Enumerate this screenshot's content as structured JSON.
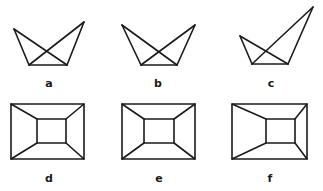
{
  "figure": {
    "colors": {
      "stroke": "#1a1a1a",
      "background": "#ffffff"
    },
    "panels": [
      {
        "label": "a",
        "type": "crossed-quadrilateral",
        "points": {
          "left_top": [
            14,
            29
          ],
          "right_top": [
            84,
            22
          ],
          "bottom_left": [
            29,
            65
          ],
          "bottom_right": [
            67,
            65
          ]
        },
        "label_pos": [
          49,
          87
        ]
      },
      {
        "label": "b",
        "type": "crossed-quadrilateral",
        "points": {
          "left_top": [
            122,
            25
          ],
          "right_top": [
            195,
            25
          ],
          "bottom_left": [
            141,
            65
          ],
          "bottom_right": [
            177,
            65
          ]
        },
        "label_pos": [
          158,
          87
        ]
      },
      {
        "label": "c",
        "type": "crossed-quadrilateral",
        "points": {
          "left_top": [
            240,
            36
          ],
          "right_top": [
            313,
            7
          ],
          "bottom_left": [
            252,
            64
          ],
          "bottom_right": [
            288,
            64
          ]
        },
        "label_pos": [
          271,
          87
        ]
      },
      {
        "label": "d",
        "type": "nested-rectangle",
        "outer": [
          11,
          104,
          84,
          159
        ],
        "inner": [
          37,
          119,
          66,
          143
        ],
        "label_pos": [
          49,
          182
        ]
      },
      {
        "label": "e",
        "type": "nested-rectangle",
        "outer": [
          122,
          104,
          195,
          159
        ],
        "inner": [
          144,
          119,
          174,
          143
        ],
        "label_pos": [
          159,
          182
        ]
      },
      {
        "label": "f",
        "type": "nested-rectangle",
        "outer": [
          232,
          104,
          307,
          159
        ],
        "inner": [
          266,
          119,
          295,
          143
        ],
        "label_pos": [
          270,
          182
        ]
      }
    ]
  }
}
